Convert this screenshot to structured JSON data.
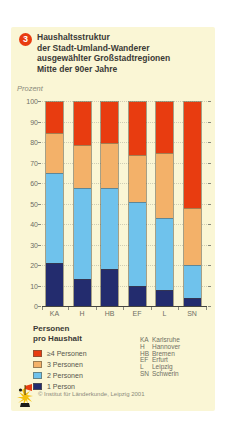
{
  "header": {
    "badge": "3",
    "title_lines": [
      "Haushaltsstruktur",
      "der Stadt-Umland-Wanderer",
      "ausgewählter Großstadtregionen",
      "Mitte der 90er Jahre"
    ],
    "unit_label": "Prozent"
  },
  "chart_data": {
    "type": "bar",
    "stacked": true,
    "title": "Haushaltsstruktur der Stadt-Umland-Wanderer ausgewählter Großstadtregionen Mitte der 90er Jahre",
    "ylabel": "Prozent",
    "ylim": [
      0,
      100
    ],
    "yticks": [
      0,
      10,
      20,
      30,
      40,
      50,
      60,
      70,
      80,
      90,
      100
    ],
    "grid": true,
    "categories": [
      "KA",
      "H",
      "HB",
      "EF",
      "L",
      "SN"
    ],
    "series": [
      {
        "name": "1 Person",
        "color": "#232c6e",
        "values": [
          21,
          13,
          18,
          10,
          8,
          4
        ]
      },
      {
        "name": "2 Personen",
        "color": "#6fc2ec",
        "values": [
          44,
          45,
          40,
          41,
          35,
          16
        ]
      },
      {
        "name": "3 Personen",
        "color": "#f3b169",
        "values": [
          20,
          21,
          22,
          23,
          32,
          28
        ]
      },
      {
        "name": "≥4 Personen",
        "color": "#e83c10",
        "values": [
          15,
          21,
          20,
          26,
          25,
          52
        ]
      }
    ],
    "legend_position": "bottom-left"
  },
  "legend": {
    "title_lines": [
      "Personen",
      "pro Haushalt"
    ]
  },
  "city_key": [
    {
      "abbr": "KA",
      "name": "Karlsruhe"
    },
    {
      "abbr": "H",
      "name": "Hannover"
    },
    {
      "abbr": "HB",
      "name": "Bremen"
    },
    {
      "abbr": "EF",
      "name": "Erfurt"
    },
    {
      "abbr": "L",
      "name": "Leipzig"
    },
    {
      "abbr": "SN",
      "name": "Schwerin"
    }
  ],
  "footer": {
    "credit": "© Institut für Länderkunde, Leipzig 2001"
  },
  "colors": {
    "card_background": "#faf6d5",
    "badge": "#e83c10",
    "axis_text": "#6f6f64",
    "gridline": "#cfcdb4"
  }
}
